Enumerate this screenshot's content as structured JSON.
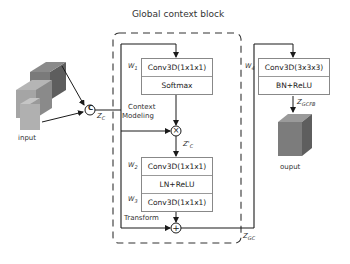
{
  "title": "Global context block",
  "input_label": "input",
  "output_label": "ouput",
  "concat_symbol": "C",
  "z_c": "Z_C",
  "z_c_prime": "Z'_C",
  "z_gc": "Z_GC",
  "z_gcfb": "Z_GCFB",
  "context_modeling": {
    "label_line1": "Context",
    "label_line2": "Modeling",
    "weight": "W1",
    "layers": [
      "Conv3D(1x1x1)",
      "Softmax"
    ],
    "op_symbol": "×"
  },
  "transform": {
    "label": "Transform",
    "weight_top": "W2",
    "weight_bottom": "W3",
    "layers": [
      "Conv3D(1x1x1)",
      "LN+ReLU",
      "Conv3D(1x1x1)"
    ],
    "op_symbol": "+"
  },
  "output_block": {
    "weight": "W4",
    "layers": [
      "Conv3D(3x3x3)",
      "BN+ReLU"
    ]
  },
  "colors": {
    "cube_dark": "#6e6e6e",
    "cube_mid": "#9a9a9a",
    "cube_light": "#bdbdbd",
    "line": "#1a1a1a",
    "dashed": "#333333"
  }
}
